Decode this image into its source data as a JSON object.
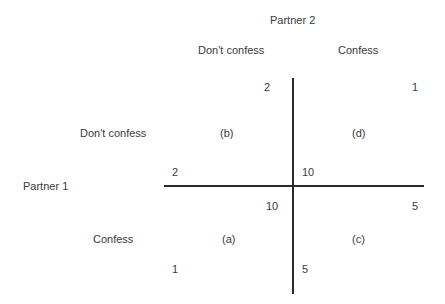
{
  "players": {
    "column_player": "Partner 2",
    "row_player": "Partner 1"
  },
  "strategies": {
    "column": [
      "Don't confess",
      "Confess"
    ],
    "row": [
      "Don't confess",
      "Confess"
    ]
  },
  "cells": {
    "b": {
      "label": "(b)",
      "row": "Don't confess",
      "col": "Don't confess",
      "partner1_payoff": "2",
      "partner2_payoff": "2"
    },
    "d": {
      "label": "(d)",
      "row": "Don't confess",
      "col": "Confess",
      "partner1_payoff": "10",
      "partner2_payoff": "1"
    },
    "a": {
      "label": "(a)",
      "row": "Confess",
      "col": "Don't confess",
      "partner1_payoff": "1",
      "partner2_payoff": "10"
    },
    "c": {
      "label": "(c)",
      "row": "Confess",
      "col": "Confess",
      "partner1_payoff": "5",
      "partner2_payoff": "5"
    }
  },
  "colors": {
    "text": "#3a3a3a",
    "lines": "#2a2a2a",
    "background": "#ffffff"
  }
}
